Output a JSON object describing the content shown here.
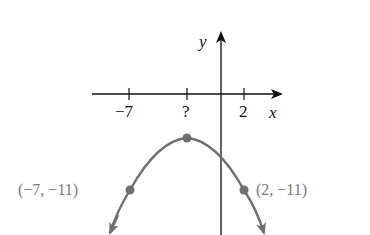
{
  "diagram": {
    "type": "parabola-graph",
    "axes": {
      "x_label": "x",
      "y_label": "y",
      "x_ticks": [
        "−7",
        "?",
        "2"
      ]
    },
    "points": [
      {
        "name": "left-point",
        "label": "(−7, −11)",
        "x": -7,
        "y": -11
      },
      {
        "name": "vertex",
        "label": "?",
        "x": "?",
        "y": null
      },
      {
        "name": "right-point",
        "label": "(2, −11)",
        "x": 2,
        "y": -11
      }
    ],
    "colors": {
      "axis": "#111111",
      "curve": "#707070",
      "label": "#7a7a7a"
    }
  }
}
